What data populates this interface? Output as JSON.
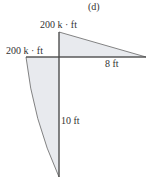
{
  "figure": {
    "panel_label": "(d)",
    "top_moment_label": "200 k · ft",
    "left_moment_label": "200 k · ft",
    "beam_length_label": "8 ft",
    "column_length_label": "10 ft",
    "fill_color": "#e8eaee",
    "line_color": "#555555"
  }
}
